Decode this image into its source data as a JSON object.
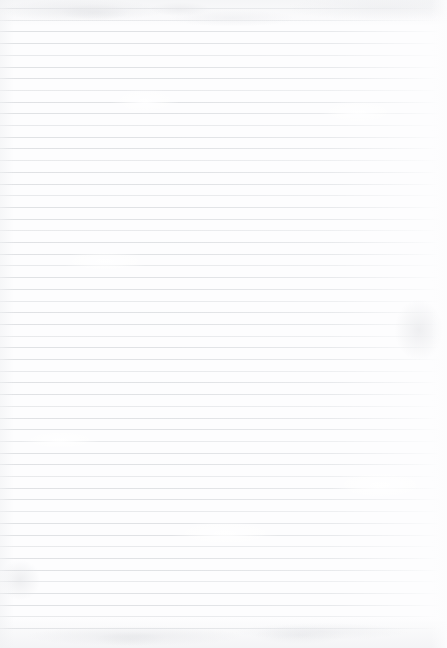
{
  "document": {
    "type": "scanned-ruled-paper",
    "title": "Blank lined notebook page",
    "page_width": 447,
    "page_height": 648,
    "has_text": false,
    "text_content": "",
    "orientation": "portrait"
  },
  "paper": {
    "background_color": "#fdfdfe",
    "edge_tint_color": "#eeeff1",
    "texture": "mottled-scan"
  },
  "ruling": {
    "style": "wide-ruled-horizontal",
    "line_color": "#e2e3e5",
    "line_thickness_px": 1,
    "line_spacing_px": 11.7,
    "first_line_y": 8,
    "last_line_y": 632,
    "line_count": 54,
    "line_start_x": 0,
    "line_end_x": 441,
    "has_vertical_margin_rule": false
  },
  "margins": {
    "top_px": 8,
    "bottom_px": 16,
    "left_px": 0,
    "right_px": 6
  },
  "annotations": {
    "handwriting": "none",
    "printed_text": "none",
    "holes_or_perforations": "none"
  }
}
